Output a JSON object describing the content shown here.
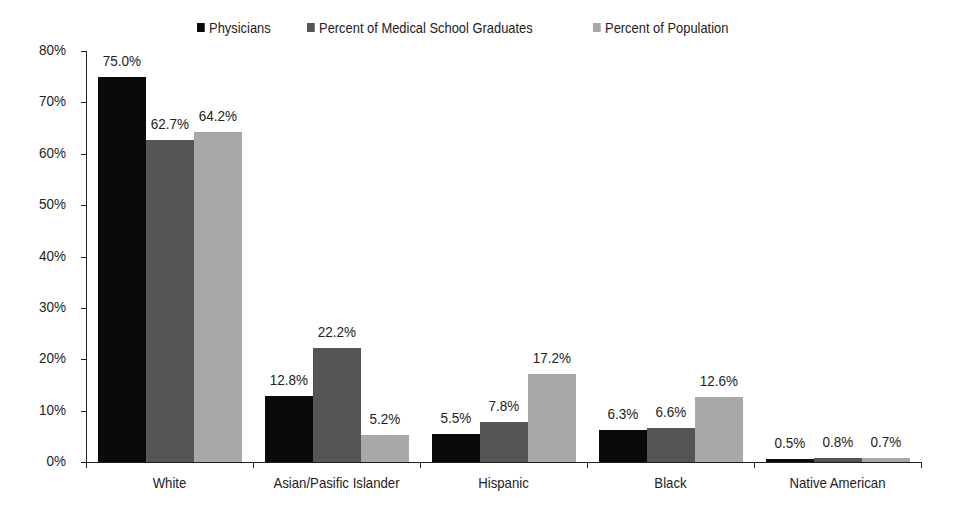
{
  "chart_data": {
    "type": "bar",
    "title": "",
    "xlabel": "",
    "ylabel": "",
    "categories": [
      "White",
      "Asian/Pasific Islander",
      "Hispanic",
      "Black",
      "Native American"
    ],
    "series": [
      {
        "name": "Physicians",
        "color": "#0a0a0a",
        "values": [
          75.0,
          12.8,
          5.5,
          6.3,
          0.5
        ],
        "labels": [
          "75.0%",
          "12.8%",
          "5.5%",
          "6.3%",
          "0.5%"
        ]
      },
      {
        "name": "Percent of Medical School Graduates",
        "color": "#555555",
        "values": [
          62.7,
          22.2,
          7.8,
          6.6,
          0.8
        ],
        "labels": [
          "62.7%",
          "22.2%",
          "7.8%",
          "6.6%",
          "0.8%"
        ]
      },
      {
        "name": "Percent of Population",
        "color": "#a8a8a8",
        "values": [
          64.2,
          5.2,
          17.2,
          12.6,
          0.7
        ],
        "labels": [
          "64.2%",
          "5.2%",
          "17.2%",
          "12.6%",
          "0.7%"
        ]
      }
    ],
    "ylim": [
      0,
      80
    ],
    "yticks": [
      0,
      10,
      20,
      30,
      40,
      50,
      60,
      70,
      80
    ],
    "ytick_labels": [
      "0%",
      "10%",
      "20%",
      "30%",
      "40%",
      "50%",
      "60%",
      "70%",
      "80%"
    ],
    "grid": false,
    "legend_position": "top"
  }
}
